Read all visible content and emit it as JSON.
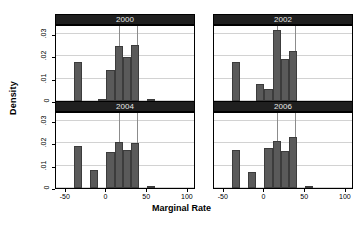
{
  "chart_data": {
    "type": "bar",
    "title": "",
    "xlabel": "Marginal Rate",
    "ylabel": "Density",
    "xlim": [
      -62,
      110
    ],
    "ylim": [
      0,
      0.0345
    ],
    "xticks": [
      -50,
      0,
      50,
      100
    ],
    "xticklabels": [
      "-50",
      "0",
      "50",
      "100"
    ],
    "yticks": [
      0,
      0.01,
      0.02,
      0.03
    ],
    "yticklabels": [
      "0",
      ".01",
      ".02",
      ".03"
    ],
    "grid": "horizontal",
    "legend": "none",
    "bin_width": 10,
    "bar_color": "#5a5a5a",
    "reference_lines": [
      15,
      38
    ],
    "panels": [
      {
        "label": "2000",
        "bins": [
          {
            "x0": -40,
            "x1": -30,
            "density": 0.0175
          },
          {
            "x0": -10,
            "x1": 0,
            "density": 0.001
          },
          {
            "x0": 0,
            "x1": 10,
            "density": 0.0138
          },
          {
            "x0": 10,
            "x1": 20,
            "density": 0.0248
          },
          {
            "x0": 20,
            "x1": 30,
            "density": 0.0197
          },
          {
            "x0": 30,
            "x1": 40,
            "density": 0.0253
          },
          {
            "x0": 50,
            "x1": 60,
            "density": 0.0004
          }
        ]
      },
      {
        "label": "2002",
        "bins": [
          {
            "x0": -40,
            "x1": -30,
            "density": 0.0177
          },
          {
            "x0": -10,
            "x1": 0,
            "density": 0.0077
          },
          {
            "x0": 0,
            "x1": 10,
            "density": 0.0055
          },
          {
            "x0": 10,
            "x1": 20,
            "density": 0.032
          },
          {
            "x0": 20,
            "x1": 30,
            "density": 0.0188
          },
          {
            "x0": 30,
            "x1": 40,
            "density": 0.0224
          }
        ]
      },
      {
        "label": "2004",
        "bins": [
          {
            "x0": -40,
            "x1": -30,
            "density": 0.0188
          },
          {
            "x0": -20,
            "x1": -10,
            "density": 0.0079
          },
          {
            "x0": 0,
            "x1": 10,
            "density": 0.0163
          },
          {
            "x0": 10,
            "x1": 20,
            "density": 0.0207
          },
          {
            "x0": 20,
            "x1": 30,
            "density": 0.0172
          },
          {
            "x0": 30,
            "x1": 40,
            "density": 0.0203
          },
          {
            "x0": 50,
            "x1": 60,
            "density": 0.0004
          }
        ]
      },
      {
        "label": "2006",
        "bins": [
          {
            "x0": -40,
            "x1": -30,
            "density": 0.0172
          },
          {
            "x0": -20,
            "x1": -10,
            "density": 0.007
          },
          {
            "x0": 0,
            "x1": 10,
            "density": 0.0181
          },
          {
            "x0": 10,
            "x1": 20,
            "density": 0.0209
          },
          {
            "x0": 20,
            "x1": 30,
            "density": 0.0168
          },
          {
            "x0": 30,
            "x1": 40,
            "density": 0.0228
          },
          {
            "x0": 50,
            "x1": 60,
            "density": 0.0004
          }
        ]
      }
    ]
  }
}
